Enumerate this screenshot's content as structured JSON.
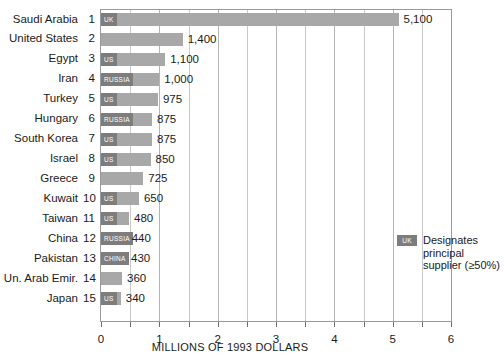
{
  "chart_data": {
    "type": "bar",
    "orientation": "horizontal",
    "title": "",
    "xlabel": "MILLIONS OF 1993 DOLLARS",
    "ylabel": "",
    "xlim": [
      0,
      6
    ],
    "xticks": [
      0,
      1,
      2,
      3,
      4,
      5,
      6
    ],
    "xtick_labels": [
      "0",
      "1",
      "2",
      "3",
      "4",
      "5",
      "6"
    ],
    "grid": true,
    "gridline_interval": 0.5,
    "value_unit": "thousands of 1993 dollars",
    "categories": [
      "Saudi Arabia",
      "United States",
      "Egypt",
      "Iran",
      "Turkey",
      "Hungary",
      "South Korea",
      "Israel",
      "Greece",
      "Kuwait",
      "Taiwan",
      "China",
      "Pakistan",
      "Un. Arab Emir.",
      "Japan"
    ],
    "ranks": [
      "1",
      "2",
      "3",
      "4",
      "5",
      "6",
      "7",
      "8",
      "9",
      "10",
      "11",
      "12",
      "13",
      "14",
      "15"
    ],
    "values": [
      5100,
      1400,
      1100,
      1000,
      975,
      875,
      875,
      850,
      725,
      650,
      480,
      440,
      430,
      360,
      340
    ],
    "value_labels": [
      "5,100",
      "1,400",
      "1,100",
      "1,000",
      "975",
      "875",
      "875",
      "850",
      "725",
      "650",
      "480",
      "440",
      "430",
      "360",
      "340"
    ],
    "suppliers": [
      "UK",
      "",
      "US",
      "RUSSIA",
      "US",
      "RUSSIA",
      "US",
      "US",
      "",
      "US",
      "US",
      "RUSSIA",
      "CHINA",
      "",
      "US"
    ],
    "colors": {
      "bar": "#a8a8a8",
      "tag": "#7d7d7d",
      "grid": "#c9c9c9",
      "frame": "#9a9a9a",
      "text": "#1a1a1a"
    }
  },
  "legend": {
    "swatch_label": "UK",
    "text": "Designates principal supplier (≥50%)"
  }
}
